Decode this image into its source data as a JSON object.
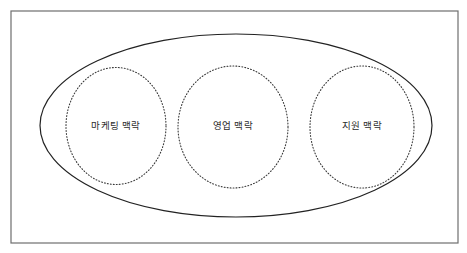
{
  "figure": {
    "type": "venn-containment-diagram",
    "background_color": "#ffffff",
    "frame": {
      "name": "outer-frame",
      "shape": "rectangle",
      "x": 11,
      "y": 11,
      "width": 447,
      "height": 232,
      "stroke_color": "#6e6e6e",
      "stroke_width": 1.2,
      "fill": "none"
    },
    "outer_boundary": {
      "name": "overall-context-ellipse",
      "shape": "ellipse",
      "cx": 236,
      "cy": 125.5,
      "rx": 196,
      "ry": 91.5,
      "stroke_color": "#222222",
      "stroke_width": 1.2,
      "stroke_style": "solid",
      "fill": "none",
      "label": ""
    },
    "inner_contexts": [
      {
        "id": "marketing",
        "label": "마케팅 맥락",
        "shape": "ellipse",
        "cx": 116,
        "cy": 126,
        "rx": 50,
        "ry": 58.5,
        "stroke_color": "#3a3a3a",
        "stroke_width": 1.1,
        "stroke_style": "dotted",
        "fill": "none",
        "label_x": 116,
        "label_y": 129
      },
      {
        "id": "sales",
        "label": "영업 맥락",
        "shape": "ellipse",
        "cx": 233,
        "cy": 127,
        "rx": 55,
        "ry": 61,
        "stroke_color": "#3a3a3a",
        "stroke_width": 1.1,
        "stroke_style": "dotted",
        "fill": "none",
        "label_x": 233,
        "label_y": 129
      },
      {
        "id": "support",
        "label": "지원 맥락",
        "shape": "ellipse",
        "cx": 362,
        "cy": 127,
        "rx": 52,
        "ry": 61,
        "stroke_color": "#3a3a3a",
        "stroke_width": 1.1,
        "stroke_style": "dotted",
        "fill": "none",
        "label_x": 362,
        "label_y": 129
      }
    ]
  }
}
